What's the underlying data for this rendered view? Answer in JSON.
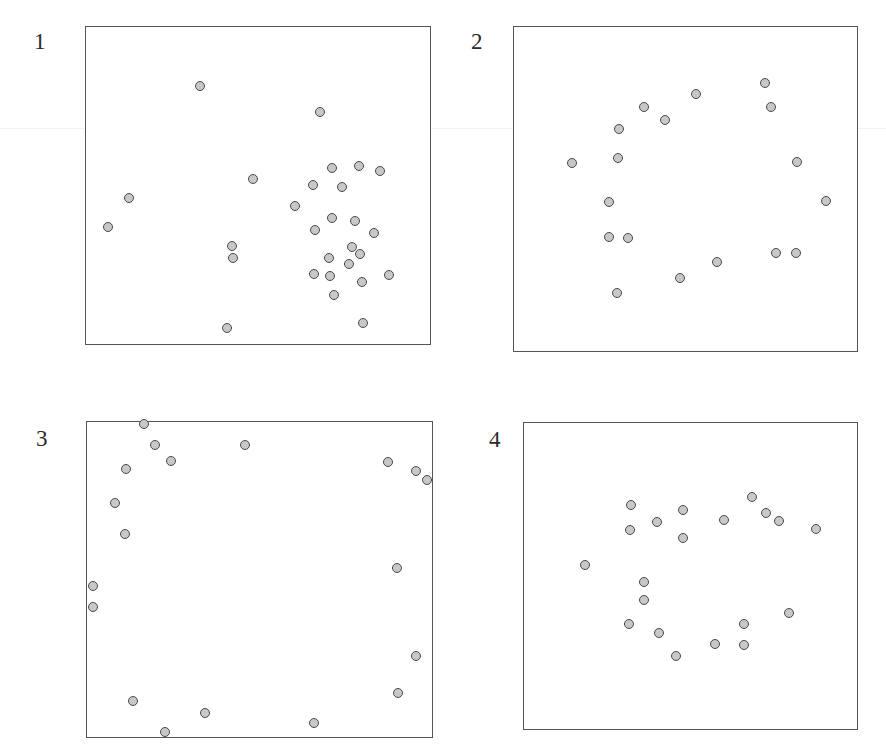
{
  "figure": {
    "background_color": "#ffffff",
    "frame_color": "#555555",
    "marker_fill_color": "#c8c8c8",
    "marker_edge_color": "#4a4a4a",
    "marker_diameter_px": 10,
    "panel_count": 4
  },
  "chart_data": [
    {
      "type": "scatter",
      "title": "1",
      "label": "1",
      "xlabel": "",
      "ylabel": "",
      "xlim": [
        0,
        100
      ],
      "ylim": [
        0,
        100
      ],
      "grid": false,
      "legend": null,
      "pattern": "clustered",
      "n_points": 27,
      "points": [
        {
          "x": 33.2,
          "y": 81.3
        },
        {
          "x": 68.0,
          "y": 72.9
        },
        {
          "x": 12.6,
          "y": 46.2
        },
        {
          "x": 6.6,
          "y": 36.9
        },
        {
          "x": 42.9,
          "y": 27.3
        },
        {
          "x": 48.5,
          "y": 51.9
        },
        {
          "x": 60.8,
          "y": 43.5
        },
        {
          "x": 66.0,
          "y": 50.2
        },
        {
          "x": 71.5,
          "y": 55.4
        },
        {
          "x": 79.2,
          "y": 56.0
        },
        {
          "x": 74.4,
          "y": 49.6
        },
        {
          "x": 85.3,
          "y": 54.5
        },
        {
          "x": 66.6,
          "y": 36.0
        },
        {
          "x": 71.5,
          "y": 39.8
        },
        {
          "x": 78.0,
          "y": 38.9
        },
        {
          "x": 83.5,
          "y": 35.2
        },
        {
          "x": 42.6,
          "y": 31.0
        },
        {
          "x": 70.6,
          "y": 27.3
        },
        {
          "x": 77.1,
          "y": 30.8
        },
        {
          "x": 79.5,
          "y": 28.4
        },
        {
          "x": 76.2,
          "y": 25.5
        },
        {
          "x": 66.3,
          "y": 22.4
        },
        {
          "x": 70.9,
          "y": 21.5
        },
        {
          "x": 80.1,
          "y": 19.9
        },
        {
          "x": 87.8,
          "y": 21.8
        },
        {
          "x": 72.1,
          "y": 15.6
        },
        {
          "x": 80.4,
          "y": 6.8
        },
        {
          "x": 41.1,
          "y": 5.3
        }
      ]
    },
    {
      "type": "scatter",
      "title": "2",
      "label": "2",
      "xlabel": "",
      "ylabel": "",
      "xlim": [
        0,
        100
      ],
      "ylim": [
        0,
        100
      ],
      "grid": false,
      "legend": null,
      "pattern": "ring",
      "n_points": 18,
      "points": [
        {
          "x": 53.1,
          "y": 79.2
        },
        {
          "x": 38.0,
          "y": 75.3
        },
        {
          "x": 73.0,
          "y": 82.6
        },
        {
          "x": 74.9,
          "y": 75.1
        },
        {
          "x": 44.2,
          "y": 71.3
        },
        {
          "x": 30.8,
          "y": 68.3
        },
        {
          "x": 30.5,
          "y": 59.4
        },
        {
          "x": 17.0,
          "y": 57.9
        },
        {
          "x": 82.3,
          "y": 58.3
        },
        {
          "x": 90.8,
          "y": 46.3
        },
        {
          "x": 27.8,
          "y": 46.0
        },
        {
          "x": 27.8,
          "y": 35.3
        },
        {
          "x": 33.3,
          "y": 35.0
        },
        {
          "x": 76.2,
          "y": 30.5
        },
        {
          "x": 82.0,
          "y": 30.3
        },
        {
          "x": 59.0,
          "y": 27.5
        },
        {
          "x": 48.5,
          "y": 22.6
        },
        {
          "x": 30.2,
          "y": 18.0
        }
      ]
    },
    {
      "type": "scatter",
      "title": "3",
      "label": "3",
      "xlabel": "",
      "ylabel": "",
      "xlim": [
        0,
        100
      ],
      "ylim": [
        0,
        100
      ],
      "grid": false,
      "legend": null,
      "pattern": "regular-border",
      "n_points": 18,
      "points": [
        {
          "x": 16.8,
          "y": 99.2
        },
        {
          "x": 20.0,
          "y": 92.4
        },
        {
          "x": 45.8,
          "y": 92.3
        },
        {
          "x": 24.5,
          "y": 87.5
        },
        {
          "x": 87.0,
          "y": 87.2
        },
        {
          "x": 95.1,
          "y": 84.3
        },
        {
          "x": 98.2,
          "y": 81.5
        },
        {
          "x": 11.4,
          "y": 85.0
        },
        {
          "x": 8.5,
          "y": 74.1
        },
        {
          "x": 11.2,
          "y": 64.4
        },
        {
          "x": 89.6,
          "y": 53.5
        },
        {
          "x": 2.0,
          "y": 48.1
        },
        {
          "x": 2.0,
          "y": 41.4
        },
        {
          "x": 95.2,
          "y": 25.8
        },
        {
          "x": 89.8,
          "y": 14.3
        },
        {
          "x": 13.6,
          "y": 11.6
        },
        {
          "x": 34.3,
          "y": 7.8
        },
        {
          "x": 22.7,
          "y": 2.0
        },
        {
          "x": 65.7,
          "y": 4.8
        }
      ]
    },
    {
      "type": "scatter",
      "title": "4",
      "label": "4",
      "xlabel": "",
      "ylabel": "",
      "xlim": [
        0,
        100
      ],
      "ylim": [
        0,
        100
      ],
      "grid": false,
      "legend": null,
      "pattern": "ring-with-inner",
      "n_points": 21,
      "points": [
        {
          "x": 32.1,
          "y": 73.1
        },
        {
          "x": 68.3,
          "y": 75.8
        },
        {
          "x": 47.9,
          "y": 71.5
        },
        {
          "x": 72.5,
          "y": 70.5
        },
        {
          "x": 60.1,
          "y": 68.3
        },
        {
          "x": 76.4,
          "y": 68.0
        },
        {
          "x": 40.0,
          "y": 67.6
        },
        {
          "x": 32.0,
          "y": 64.9
        },
        {
          "x": 87.4,
          "y": 65.1
        },
        {
          "x": 47.8,
          "y": 62.4
        },
        {
          "x": 18.5,
          "y": 53.5
        },
        {
          "x": 36.0,
          "y": 48.2
        },
        {
          "x": 36.0,
          "y": 42.2
        },
        {
          "x": 79.3,
          "y": 38.0
        },
        {
          "x": 31.5,
          "y": 34.4
        },
        {
          "x": 66.0,
          "y": 34.3
        },
        {
          "x": 40.5,
          "y": 31.6
        },
        {
          "x": 57.3,
          "y": 27.8
        },
        {
          "x": 66.0,
          "y": 27.6
        },
        {
          "x": 45.8,
          "y": 24.0
        }
      ]
    }
  ],
  "panels": [
    {
      "name": "panel-1",
      "label": "1",
      "left": 85,
      "top": 26,
      "width": 346,
      "height": 319,
      "label_left": 34,
      "label_top": 30
    },
    {
      "name": "panel-2",
      "label": "2",
      "left": 513,
      "top": 26,
      "width": 345,
      "height": 326,
      "label_left": 471,
      "label_top": 30
    },
    {
      "name": "panel-3",
      "label": "3",
      "left": 86,
      "top": 421,
      "width": 347,
      "height": 317,
      "label_left": 36,
      "label_top": 427
    },
    {
      "name": "panel-4",
      "label": "4",
      "left": 523,
      "top": 422,
      "width": 335,
      "height": 308,
      "label_left": 489,
      "label_top": 428
    }
  ],
  "decor": {
    "faint_rule_color": "#f4f2ee",
    "faint_rule_top": 128
  }
}
